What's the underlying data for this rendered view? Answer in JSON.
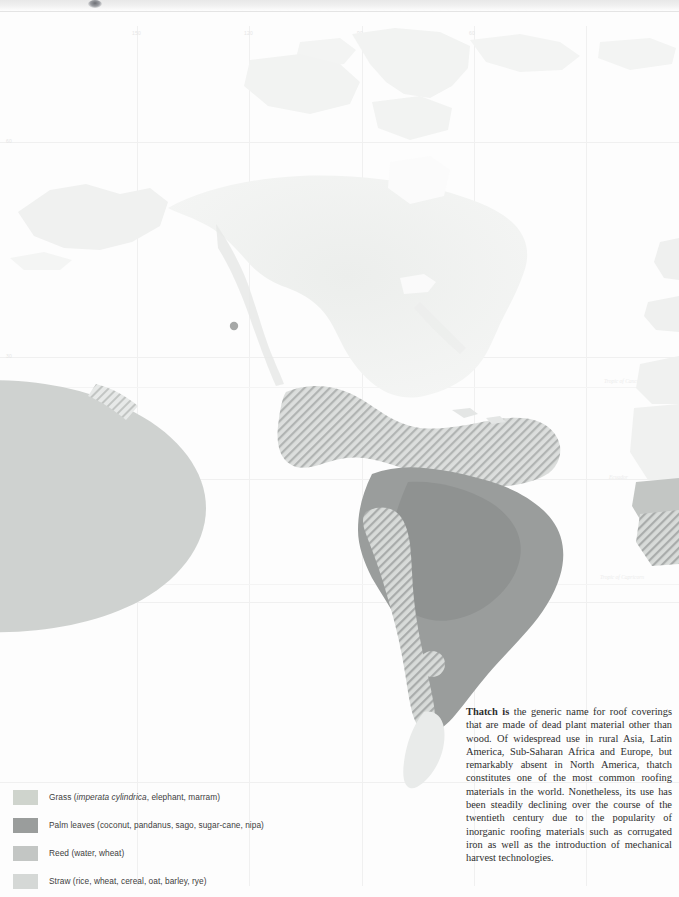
{
  "page": {
    "width": 679,
    "height": 897
  },
  "map": {
    "name": "world-thatch-distribution-map",
    "projection_labels": {
      "tropic_of_cancer": "Tropic of Cancer",
      "equator": "Ecuador",
      "tropic_of_capricorn": "Tropic of Capricorn"
    },
    "longitude_labels": [
      "150",
      "120",
      "90",
      "60"
    ],
    "latitude_labels": [
      "60",
      "30",
      "0",
      "30"
    ],
    "colors": {
      "ocean": "#fdfdfd",
      "land": "#f1f2f1",
      "grid": "#f0f0f0",
      "grass": "#cfd4cd",
      "palm_leaves": "#9a9d9c",
      "reed": "#c3c6c4",
      "straw": "#d5d8d6"
    }
  },
  "legend": {
    "name": "map-legend",
    "items": [
      {
        "key": "grass",
        "color": "#cfd4cd",
        "label_main": "Grass (",
        "label_italic": "imperata cylindrica",
        "label_tail": ", elephant, marram)"
      },
      {
        "key": "palm-leaves",
        "color": "#9a9d9c",
        "label_main": "Palm leaves (coconut, pandanus, sago, sugar-cane, nipa)",
        "label_italic": "",
        "label_tail": ""
      },
      {
        "key": "reed",
        "color": "#c3c6c4",
        "label_main": "Reed (water, wheat)",
        "label_italic": "",
        "label_tail": ""
      },
      {
        "key": "straw",
        "color": "#d5d8d6",
        "label_main": "Straw (rice, wheat, cereal, oat, barley, rye)",
        "label_italic": "",
        "label_tail": ""
      }
    ]
  },
  "description": {
    "name": "thatch-description",
    "lead": "Thatch is",
    "body": " the generic name for roof coverings that are made of dead plant material other than wood. Of widespread use in rural Asia, Latin America, Sub-Saharan Africa and Europe, but remarkably absent in North America, thatch constitutes one of the most common roofing materials in the world. Nonetheless, its use has been steadily declining over the course of the twentieth century due to the popularity of inorganic roofing materials such as corrugated iron as well as the introduction of mechanical harvest technologies."
  }
}
